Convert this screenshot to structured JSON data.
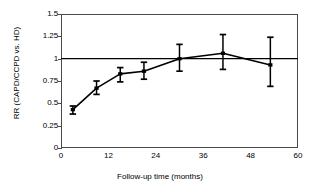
{
  "chart_data": {
    "type": "line",
    "title": "",
    "subtitle": "",
    "xlabel": "Follow-up time (months)",
    "ylabel": "RR (CAPD/CCPD vs. HD)",
    "xlim": [
      0,
      60
    ],
    "ylim": [
      0,
      1.5
    ],
    "xticks": [
      0,
      12,
      24,
      36,
      48,
      60
    ],
    "xticklabels": [
      "0",
      "12",
      "24",
      "36",
      "48",
      "60"
    ],
    "yticks": [
      0,
      0.25,
      0.5,
      0.75,
      1,
      1.25,
      1.5
    ],
    "yticklabels": [
      "0",
      "0.25",
      "0.5",
      "0.75",
      "1",
      "1.25",
      "1.5"
    ],
    "grid": false,
    "legend": null,
    "reference_line": {
      "y": 1,
      "label": "",
      "color": "#000000"
    },
    "series": [
      {
        "name": "RR (CAPD/CCPD vs. HD)",
        "marker": "error-bar",
        "color": "#000000",
        "x": [
          3,
          9,
          15,
          21,
          30,
          41,
          53
        ],
        "values": [
          0.43,
          0.67,
          0.83,
          0.86,
          1.0,
          1.06,
          0.93
        ],
        "error_low": [
          0.38,
          0.6,
          0.74,
          0.77,
          0.86,
          0.88,
          0.69
        ],
        "error_high": [
          0.47,
          0.75,
          0.9,
          0.96,
          1.16,
          1.27,
          1.24
        ]
      }
    ]
  }
}
